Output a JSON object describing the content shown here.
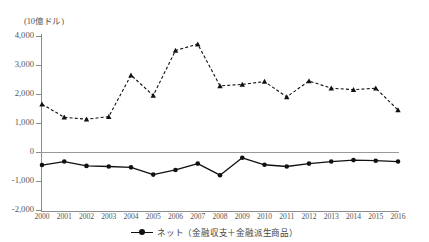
{
  "chart_data": {
    "type": "line",
    "title": "",
    "subtitle": "",
    "unit_label": "(10億ドル)",
    "xlabel": "",
    "ylabel": "",
    "ylim": [
      -2000,
      4000
    ],
    "yticks": [
      4000,
      3000,
      2000,
      1000,
      0,
      -1000,
      -2000
    ],
    "ytick_labels": [
      "4,000",
      "3,000",
      "2,000",
      "1,000",
      "0",
      "-1,000",
      "-2,000"
    ],
    "grid": false,
    "zero_line": true,
    "legend_position": "bottom-center",
    "categories": [
      2000,
      2001,
      2002,
      2003,
      2004,
      2005,
      2006,
      2007,
      2008,
      2009,
      2010,
      2011,
      2012,
      2013,
      2014,
      2015,
      2016
    ],
    "xtick_labels": [
      "2000",
      "2001",
      "2002",
      "2003",
      "2004",
      "2005",
      "2006",
      "2007",
      "2008",
      "2009",
      "2010",
      "2011",
      "2012",
      "2013",
      "2014",
      "2015",
      "2016"
    ],
    "series": [
      {
        "name": "gross-series",
        "legend_label": "",
        "style": "dashed",
        "marker": "triangle",
        "color": "#111111",
        "values": [
          1650,
          1200,
          1130,
          1220,
          2650,
          1950,
          3500,
          3720,
          2280,
          2330,
          2430,
          1900,
          2450,
          2200,
          2150,
          2200,
          1450
        ]
      },
      {
        "name": "net-series",
        "legend_label": "ネット（金融収支＋金融派生商品）",
        "style": "solid",
        "marker": "circle",
        "color": "#111111",
        "values": [
          -450,
          -330,
          -480,
          -500,
          -530,
          -780,
          -620,
          -400,
          -800,
          -200,
          -440,
          -500,
          -400,
          -330,
          -280,
          -300,
          -330
        ]
      }
    ]
  },
  "legend": {
    "entries": [
      {
        "label": "ネット（金融収支＋金融派生商品）"
      }
    ]
  }
}
